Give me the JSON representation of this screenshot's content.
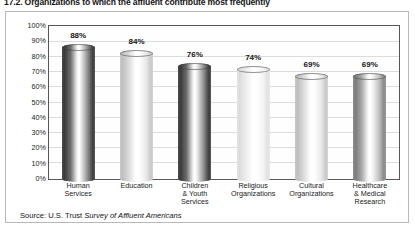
{
  "title": "17.2. Organizations to which the affluent contribute most frequently",
  "source": {
    "prefix": "Source: U.S. Trust ",
    "italic": "Survey of Affluent Americans"
  },
  "chart_data": {
    "type": "bar",
    "title": "17.2. Organizations to which the affluent contribute most frequently",
    "categories": [
      "Human\nServices",
      "Education",
      "Children\n& Youth\nServices",
      "Religious\nOrganizations",
      "Cultural\nOrganizations",
      "Healthcare\n& Medical\nResearch"
    ],
    "values": [
      88,
      84,
      76,
      74,
      69,
      69
    ],
    "value_labels": [
      "88%",
      "84%",
      "76%",
      "74%",
      "69%",
      "69%"
    ],
    "bar_shades": [
      "dark",
      "light",
      "dark",
      "pale",
      "light",
      "mid"
    ],
    "xlabel": "",
    "ylabel": "",
    "ylim": [
      0,
      100
    ],
    "ytick_labels": [
      "100%",
      "90%",
      "80%",
      "70%",
      "60%",
      "50%",
      "40%",
      "30%",
      "20%",
      "10%",
      "0%"
    ],
    "ytick_values": [
      100,
      90,
      80,
      70,
      60,
      50,
      40,
      30,
      20,
      10,
      0
    ],
    "grid": true,
    "legend": "none",
    "source": "Source: U.S. Trust Survey of Affluent Americans"
  }
}
